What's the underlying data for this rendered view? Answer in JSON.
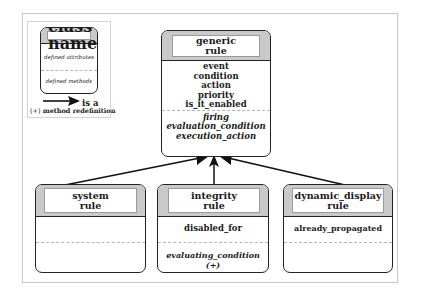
{
  "legend": {
    "class_name": "class name",
    "defined_attributes": "defined attributes",
    "defined_methods": "defined methods",
    "arrow_label": "is a",
    "redefinition_marker": "(+)",
    "redefinition_label": "method redefinition"
  },
  "classes": {
    "generic": {
      "name_line1": "generic",
      "name_line2": "rule",
      "attributes": [
        "event",
        "condition",
        "action",
        "priority",
        "is_it_enabled"
      ],
      "methods": [
        "firing",
        "evaluation_condition",
        "execution_action"
      ]
    },
    "system": {
      "name_line1": "system",
      "name_line2": "rule",
      "attributes": [],
      "methods": []
    },
    "integrity": {
      "name_line1": "integrity",
      "name_line2": "rule",
      "attributes": [
        "disabled_for"
      ],
      "methods": [
        "evaluating_condition (+)"
      ]
    },
    "dynamic_display": {
      "name_line1": "dynamic_display",
      "name_line2": "rule",
      "attributes": [
        "already_propagated"
      ],
      "methods": []
    }
  },
  "relations": [
    {
      "from": "system rule",
      "to": "generic rule",
      "type": "is a"
    },
    {
      "from": "integrity rule",
      "to": "generic rule",
      "type": "is a"
    },
    {
      "from": "dynamic_display rule",
      "to": "generic rule",
      "type": "is a"
    }
  ],
  "colors": {
    "header_fill": "#c9c9c9",
    "border": "#222222",
    "frame": "#c8c8c8"
  }
}
